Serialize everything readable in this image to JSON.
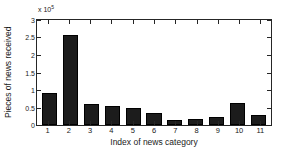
{
  "chart_data": {
    "type": "bar",
    "title": "",
    "subtitle": "",
    "xlabel": "Index of news category",
    "ylabel": "Pieces of news received",
    "y_multiplier_text": "x 10",
    "y_multiplier_exponent": "5",
    "y_multiplier_value": 100000,
    "categories": [
      "1",
      "2",
      "3",
      "4",
      "5",
      "6",
      "7",
      "8",
      "9",
      "10",
      "11"
    ],
    "values": [
      0.92,
      2.57,
      0.59,
      0.55,
      0.5,
      0.33,
      0.15,
      0.18,
      0.22,
      0.62,
      0.29
    ],
    "values_absolute": [
      92000,
      257000,
      59000,
      55000,
      50000,
      33000,
      15000,
      18000,
      22000,
      62000,
      29000
    ],
    "ylim": [
      0,
      3
    ],
    "yticks": [
      "0",
      "0.5",
      "1",
      "1.5",
      "2",
      "2.5",
      "3"
    ],
    "ytick_values": [
      0,
      0.5,
      1,
      1.5,
      2,
      2.5,
      3
    ],
    "xticks": [
      "1",
      "2",
      "3",
      "4",
      "5",
      "6",
      "7",
      "8",
      "9",
      "10",
      "11"
    ],
    "grid": false,
    "legend": null,
    "legend_position": "none",
    "bar_color": "#1c1c1c",
    "axis_color": "#262626",
    "background_color": "#ffffff"
  }
}
